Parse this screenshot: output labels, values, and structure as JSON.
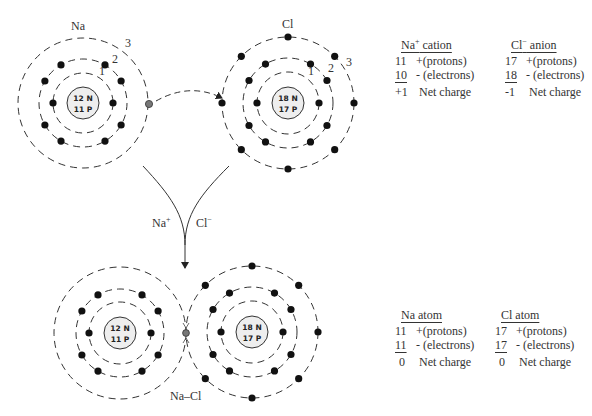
{
  "atoms": {
    "top_na": {
      "label": "Na",
      "nucleus": {
        "neutrons": "12 N",
        "protons": "11 P"
      },
      "shell_labels": [
        "1",
        "2",
        "3"
      ],
      "electrons_per_shell": [
        2,
        8,
        1
      ]
    },
    "top_cl": {
      "label": "Cl",
      "nucleus": {
        "neutrons": "18 N",
        "protons": "17 P"
      },
      "shell_labels": [
        "1",
        "2",
        "3"
      ],
      "electrons_per_shell": [
        2,
        8,
        8
      ]
    },
    "bottom_na": {
      "nucleus": {
        "neutrons": "12 N",
        "protons": "11 P"
      },
      "electrons_per_shell": [
        2,
        8
      ]
    },
    "bottom_cl": {
      "nucleus": {
        "neutrons": "18 N",
        "protons": "17 P"
      },
      "electrons_per_shell": [
        2,
        8,
        7
      ]
    }
  },
  "arrows": {
    "left_label": "Na",
    "left_sup": "+",
    "right_label": "Cl",
    "right_sup": "−"
  },
  "bond_label": "Na–Cl",
  "tables": {
    "na_cation": {
      "title": "Na",
      "title_sup": "+",
      "title_suffix": " cation",
      "rows": [
        {
          "value": "11",
          "sign": "+",
          "desc": "(protons)"
        },
        {
          "value": "10",
          "sign": "-",
          "desc": " (electrons)"
        },
        {
          "value": "+1",
          "sign": "",
          "desc": "Net charge"
        }
      ]
    },
    "cl_anion": {
      "title": "Cl",
      "title_sup": "−",
      "title_suffix": " anion",
      "rows": [
        {
          "value": "17",
          "sign": "+",
          "desc": "(protons)"
        },
        {
          "value": "18",
          "sign": "-",
          "desc": " (electrons)"
        },
        {
          "value": "-1",
          "sign": "",
          "desc": "Net charge"
        }
      ]
    },
    "na_atom": {
      "title": "Na atom",
      "rows": [
        {
          "value": "11",
          "sign": "+",
          "desc": "(protons)"
        },
        {
          "value": "11",
          "sign": "-",
          "desc": " (electrons)"
        },
        {
          "value": "0",
          "sign": "",
          "desc": "Net charge"
        }
      ]
    },
    "cl_atom": {
      "title": "Cl atom",
      "rows": [
        {
          "value": "17",
          "sign": "+",
          "desc": "(protons)"
        },
        {
          "value": "17",
          "sign": "-",
          "desc": " (electrons)"
        },
        {
          "value": "0",
          "sign": "",
          "desc": "Net charge"
        }
      ]
    }
  },
  "colors": {
    "electron": "#111111",
    "transfer_electron": "#777777",
    "nucleus_fill": "#eeeeee",
    "line": "#333333"
  }
}
